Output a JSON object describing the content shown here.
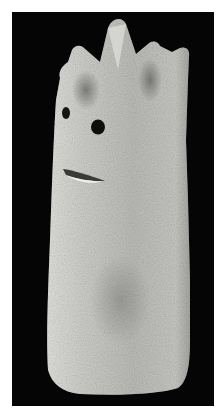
{
  "image": {
    "subject": "stone sculpture figure with crown-like pointed top, two eye holes and a slit mouth",
    "background_color": "#050505",
    "border_color": "#ffffff",
    "stone_color": "#c9c9c6",
    "shadow_color": "#7d7d7a",
    "features": {
      "crown_points": 5,
      "eyes": 2,
      "mouth": "horizontal slit"
    }
  }
}
